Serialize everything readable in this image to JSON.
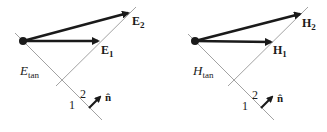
{
  "panels": [
    {
      "id": "electric",
      "vector1": {
        "symbol": "E",
        "subscript": "1"
      },
      "vector2": {
        "symbol": "E",
        "subscript": "2"
      },
      "tangent_label": {
        "symbol": "E",
        "subscript": "tan"
      },
      "region1": "1",
      "region2": "2",
      "normal": "n̂"
    },
    {
      "id": "magnetic",
      "vector1": {
        "symbol": "H",
        "subscript": "1"
      },
      "vector2": {
        "symbol": "H",
        "subscript": "2"
      },
      "tangent_label": {
        "symbol": "H",
        "subscript": "tan"
      },
      "region1": "1",
      "region2": "2",
      "normal": "n̂"
    }
  ],
  "colors": {
    "arrow": "#1a1a1a",
    "line": "#8a8a8a",
    "text": "#1a1a1a"
  }
}
